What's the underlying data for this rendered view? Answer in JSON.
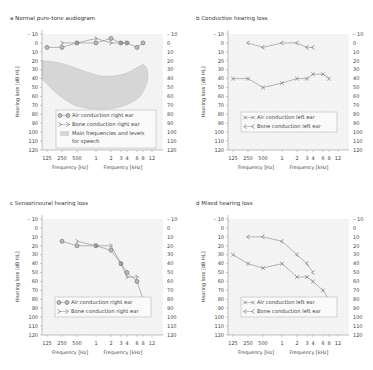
{
  "chart_data": [
    {
      "id": "a",
      "type": "line",
      "title": "a  Normal pure-tone audiogram",
      "xlabel_left": "Frequency [Hz]",
      "xlabel_right": "Frequency [kHz]",
      "ylabel": "Hearing loss [dB HL]",
      "x_ticks": [
        "125",
        "250",
        "500",
        "1",
        "2",
        "3",
        "4",
        "6",
        "8",
        "12"
      ],
      "y_ticks": [
        -10,
        0,
        10,
        20,
        30,
        40,
        50,
        60,
        70,
        80,
        90,
        100,
        110,
        120
      ],
      "ylim": [
        -10,
        120
      ],
      "grid": true,
      "series": [
        {
          "name": "Air conduction right ear",
          "marker": "circle",
          "x": [
            "125",
            "250",
            "500",
            "1",
            "2",
            "3",
            "4",
            "6",
            "8"
          ],
          "values": [
            5,
            5,
            0,
            0,
            -5,
            0,
            0,
            5,
            0
          ]
        },
        {
          "name": "Bone conduction right ear",
          "marker": ">",
          "x": [
            "250",
            "500",
            "1",
            "2",
            "3",
            "4"
          ],
          "values": [
            0,
            0,
            -5,
            0,
            0,
            0
          ]
        }
      ],
      "shaded_region": {
        "name": "Main frequencies and levels for speech"
      },
      "legend": [
        "Air conduction right ear",
        "Bone conduction right ear",
        "Main frequencies and levels for speech"
      ]
    },
    {
      "id": "b",
      "type": "line",
      "title": "b  Conductive hearing loss",
      "xlabel_left": "Frequency [Hz]",
      "xlabel_right": "Frequency [kHz]",
      "ylabel": "Hearing loss [dB HL]",
      "x_ticks": [
        "125",
        "250",
        "500",
        "1",
        "2",
        "3",
        "4",
        "6",
        "8",
        "12"
      ],
      "y_ticks": [
        -10,
        0,
        10,
        20,
        30,
        40,
        50,
        60,
        70,
        80,
        90,
        100,
        110,
        120
      ],
      "ylim": [
        -10,
        120
      ],
      "grid": true,
      "series": [
        {
          "name": "Air conduction left ear",
          "marker": "x",
          "x": [
            "125",
            "250",
            "500",
            "1",
            "2",
            "3",
            "4",
            "6",
            "8"
          ],
          "values": [
            40,
            40,
            50,
            45,
            40,
            40,
            35,
            35,
            40
          ]
        },
        {
          "name": "Bone conduction left ear",
          "marker": "<",
          "x": [
            "250",
            "500",
            "1",
            "2",
            "3",
            "4"
          ],
          "values": [
            0,
            5,
            0,
            0,
            5,
            5
          ]
        }
      ],
      "legend": [
        "Air conduction left ear",
        "Bone conduction left ear"
      ]
    },
    {
      "id": "c",
      "type": "line",
      "title": "c  Sensorineural hearing loss",
      "xlabel_left": "Frequency [Hz]",
      "xlabel_right": "Frequency [kHz]",
      "ylabel": "Hearing loss [dB HL]",
      "x_ticks": [
        "125",
        "250",
        "500",
        "1",
        "2",
        "3",
        "4",
        "6",
        "8",
        "12"
      ],
      "y_ticks": [
        -10,
        0,
        10,
        20,
        30,
        40,
        50,
        60,
        70,
        80,
        90,
        100,
        110,
        120
      ],
      "ylim": [
        -10,
        120
      ],
      "grid": true,
      "series": [
        {
          "name": "Air conduction right ear",
          "marker": "circle",
          "x": [
            "250",
            "500",
            "1",
            "2",
            "3",
            "4",
            "6",
            "8"
          ],
          "values": [
            15,
            20,
            20,
            25,
            40,
            50,
            60,
            80
          ]
        },
        {
          "name": "Bone conduction right ear",
          "marker": ">",
          "x": [
            "500",
            "1",
            "2",
            "3",
            "4",
            "6"
          ],
          "values": [
            15,
            20,
            20,
            40,
            55,
            55
          ]
        }
      ],
      "legend": [
        "Air conduction right ear",
        "Bone conduction right ear"
      ]
    },
    {
      "id": "d",
      "type": "line",
      "title": "d  Mixed hearing loss",
      "xlabel_left": "Frequency [Hz]",
      "xlabel_right": "Frequency [kHz]",
      "ylabel": "Hearing loss [dB HL]",
      "x_ticks": [
        "125",
        "250",
        "500",
        "1",
        "2",
        "3",
        "4",
        "6",
        "8",
        "12"
      ],
      "y_ticks": [
        -10,
        0,
        10,
        20,
        30,
        40,
        50,
        60,
        70,
        80,
        90,
        100,
        110,
        120
      ],
      "ylim": [
        -10,
        120
      ],
      "grid": true,
      "series": [
        {
          "name": "Air conduction left ear",
          "marker": "x",
          "x": [
            "125",
            "250",
            "500",
            "1",
            "2",
            "3",
            "4",
            "6",
            "8"
          ],
          "values": [
            30,
            40,
            45,
            40,
            55,
            55,
            60,
            70,
            80
          ]
        },
        {
          "name": "Bone conduction left ear",
          "marker": "<",
          "x": [
            "250",
            "500",
            "1",
            "2",
            "3",
            "4"
          ],
          "values": [
            10,
            10,
            15,
            30,
            40,
            50
          ]
        }
      ],
      "legend": [
        "Air conduction left ear",
        "Bone conduction left ear"
      ]
    }
  ],
  "panels": {
    "a": {
      "title": "a  Normal pure-tone audiogram"
    },
    "b": {
      "title": "b  Conductive hearing loss"
    },
    "c": {
      "title": "c  Sensorineural hearing loss"
    },
    "d": {
      "title": "d  Mixed hearing loss"
    }
  }
}
